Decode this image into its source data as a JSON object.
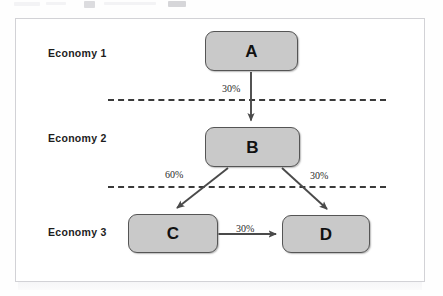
{
  "figure": {
    "tiers": [
      {
        "id": "economy-1",
        "label": "Economy 1"
      },
      {
        "id": "economy-2",
        "label": "Economy 2"
      },
      {
        "id": "economy-3",
        "label": "Economy 3"
      }
    ],
    "nodes": [
      {
        "id": "A",
        "label": "A",
        "tier": "Economy 1"
      },
      {
        "id": "B",
        "label": "B",
        "tier": "Economy 2"
      },
      {
        "id": "C",
        "label": "C",
        "tier": "Economy 3"
      },
      {
        "id": "D",
        "label": "D",
        "tier": "Economy 3"
      }
    ],
    "edges": [
      {
        "id": "a-to-b",
        "from": "A",
        "to": "B",
        "label": "30%",
        "crosses_divider": true
      },
      {
        "id": "b-to-c",
        "from": "B",
        "to": "C",
        "label": "60%",
        "crosses_divider": true
      },
      {
        "id": "b-to-d",
        "from": "B",
        "to": "D",
        "label": "30%",
        "crosses_divider": true
      },
      {
        "id": "c-to-d",
        "from": "C",
        "to": "D",
        "label": "30%",
        "crosses_divider": false
      }
    ],
    "colors": {
      "node_fill": "#c9c9c9",
      "node_border": "#555555",
      "arrow": "#4a4a4a",
      "divider": "#3a3a3a",
      "frame": "#d2d2d6",
      "text": "#111111"
    }
  }
}
